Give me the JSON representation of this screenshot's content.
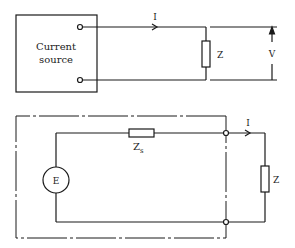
{
  "top_circuit": {
    "source_label_line1": "Current",
    "source_label_line2": "source",
    "current_label": "I",
    "load_label": "Z",
    "voltage_label": "V"
  },
  "bottom_circuit": {
    "emf_label": "E",
    "source_impedance_label": "Z",
    "source_impedance_subscript": "s",
    "current_label": "I",
    "load_label": "Z"
  },
  "colors": {
    "line": "#1a1a1a",
    "background": "#ffffff"
  }
}
